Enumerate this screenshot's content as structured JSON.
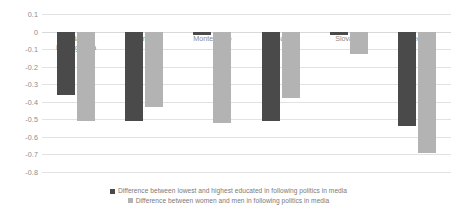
{
  "chart_data": {
    "type": "bar",
    "title": "",
    "subtitle": "",
    "xlabel": "",
    "ylabel": "",
    "ylim": [
      -0.8,
      0.1
    ],
    "ytick_labels": [
      "0.1",
      "0",
      "-0.1",
      "-0.2",
      "-0.3",
      "-0.4",
      "-0.5",
      "-0.6",
      "-0.7",
      "-0.8"
    ],
    "ytick_values": [
      0.1,
      0,
      -0.1,
      -0.2,
      -0.3,
      -0.4,
      -0.5,
      -0.6,
      -0.7,
      -0.8
    ],
    "grid": true,
    "legend_position": "bottom",
    "categories": [
      "Bosnia and Herzegovina",
      "Serbia",
      "Montenegro",
      "Croatia",
      "Slovakia",
      "Macedonia"
    ],
    "series": [
      {
        "name": "Difference between lowest and highest educated in following politics in media",
        "color": "#4a4a4a",
        "values": [
          -0.36,
          -0.51,
          -0.02,
          -0.51,
          -0.02,
          -0.54
        ]
      },
      {
        "name": "Difference between women and men in following politics in media",
        "color": "#b3b3b3",
        "values": [
          -0.51,
          -0.43,
          -0.52,
          -0.38,
          -0.13,
          -0.69
        ]
      }
    ]
  },
  "legend": {
    "items": [
      {
        "label": "Difference between lowest and highest educated in following politics in media",
        "color": "#4a4a4a"
      },
      {
        "label": "Difference between women and men in following politics in media",
        "color": "#b3b3b3"
      }
    ]
  }
}
